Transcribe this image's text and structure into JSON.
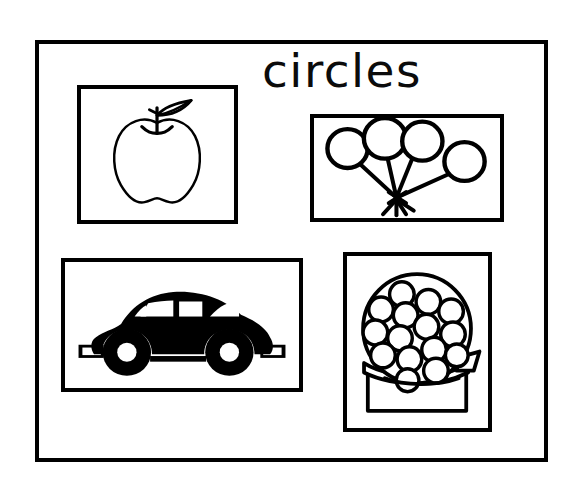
{
  "worksheet": {
    "title": "circles",
    "page_width": 578,
    "page_height": 479,
    "background_color": "#ffffff",
    "ink_color": "#000000",
    "frame": {
      "name": "outer-border",
      "border_width_px": 4
    }
  },
  "panels": [
    {
      "id": "apple",
      "label": "apple",
      "icon": "apple-outline-icon",
      "style": "outline line drawing",
      "position": "top-left",
      "contents": "apple with stem and single leaf",
      "shape_count": 1,
      "filled": false
    },
    {
      "id": "balloons",
      "label": "balloons",
      "icon": "balloons-icon",
      "style": "thick outline line drawing",
      "position": "top-right",
      "contents": "bunch of four round balloons with strings tied in a knot",
      "shape_count": 4,
      "filled": false
    },
    {
      "id": "car",
      "label": "car",
      "icon": "beetle-car-silhouette-icon",
      "style": "solid black silhouette",
      "position": "bottom-left",
      "contents": "Volkswagen Beetle side view with two round wheels",
      "shape_count": 2,
      "filled": true
    },
    {
      "id": "gumball",
      "label": "gumball machine",
      "icon": "gumball-machine-icon",
      "style": "outline line drawing",
      "position": "bottom-right",
      "contents": "gumball machine globe filled with round gumballs on a base",
      "shape_count": 15,
      "filled": false
    }
  ]
}
